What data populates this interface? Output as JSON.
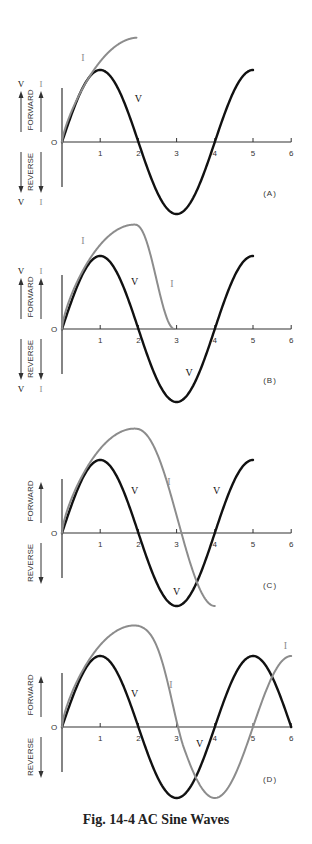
{
  "caption": "Fig. 14-4 AC Sine Waves",
  "colors": {
    "voltage": "#111111",
    "current": "#8c8c8c",
    "axis": "#333333",
    "text": "#333333"
  },
  "axis_labels": {
    "forward": "FORWARD",
    "reverse": "REVERSE",
    "origin": "O",
    "v": "V",
    "i": "I"
  },
  "chart_data": [
    {
      "type": "line",
      "panel": "(A)",
      "title": "(A)",
      "xlabel": "",
      "ylabel": "FORWARD / REVERSE",
      "x_ticks": [
        "1",
        "2",
        "3",
        "4",
        "5",
        "6"
      ],
      "xlim": [
        0,
        6
      ],
      "ylim": [
        -1,
        1
      ],
      "side_labels": {
        "top": [
          "V",
          "I"
        ],
        "bottom": [
          "V",
          "I"
        ]
      },
      "series": [
        {
          "name": "V",
          "kind": "sine",
          "x_start": 0,
          "x_end": 5,
          "amplitude": 1.0,
          "period": 4,
          "phase": 0
        },
        {
          "name": "I",
          "kind": "rise",
          "x_start": 0,
          "x_end": 1.95,
          "peak": 1.45,
          "fall_end": null
        }
      ],
      "annotations": [
        {
          "text": "V",
          "x": 2.0,
          "y": 0.55
        },
        {
          "text": "I",
          "x": 0.55,
          "y": 1.12
        }
      ]
    },
    {
      "type": "line",
      "panel": "(B)",
      "title": "(B)",
      "x_ticks": [
        "1",
        "2",
        "3",
        "4",
        "5",
        "6"
      ],
      "xlim": [
        0,
        6
      ],
      "ylim": [
        -1,
        1
      ],
      "side_labels": {
        "top": [
          "V",
          "I"
        ],
        "bottom": [
          "V",
          "I"
        ]
      },
      "series": [
        {
          "name": "V",
          "kind": "sine",
          "x_start": 0,
          "x_end": 5,
          "amplitude": 1.0,
          "period": 4,
          "phase": 0
        },
        {
          "name": "I",
          "kind": "rise-fall",
          "x_start": 0,
          "peak_x": 1.9,
          "peak": 1.43,
          "x_end": 2.95,
          "end_y": 0
        }
      ],
      "annotations": [
        {
          "text": "V",
          "x": 1.9,
          "y": 0.6
        },
        {
          "text": "I",
          "x": 0.55,
          "y": 1.17
        },
        {
          "text": "I",
          "x": 2.88,
          "y": 0.58
        },
        {
          "text": "V",
          "x": 3.33,
          "y": -0.65
        }
      ]
    },
    {
      "type": "line",
      "panel": "(C)",
      "title": "(C)",
      "x_ticks": [
        "1",
        "2",
        "3",
        "4",
        "5",
        "6"
      ],
      "xlim": [
        0,
        6
      ],
      "ylim": [
        -1,
        1
      ],
      "side_labels": null,
      "series": [
        {
          "name": "V",
          "kind": "sine",
          "x_start": 0,
          "x_end": 5,
          "amplitude": 1.0,
          "period": 4,
          "phase": 0
        },
        {
          "name": "I",
          "kind": "rise-fall",
          "x_start": 0,
          "peak_x": 1.9,
          "peak": 1.43,
          "x_end": 4.0,
          "end_y": -1.0
        }
      ],
      "annotations": [
        {
          "text": "V",
          "x": 1.9,
          "y": 0.53
        },
        {
          "text": "I",
          "x": 2.8,
          "y": 0.66
        },
        {
          "text": "V",
          "x": 4.05,
          "y": 0.53
        },
        {
          "text": "V",
          "x": 3.0,
          "y": -0.85
        }
      ]
    },
    {
      "type": "line",
      "panel": "(D)",
      "title": "(D)",
      "x_ticks": [
        "1",
        "2",
        "3",
        "4",
        "5",
        "6"
      ],
      "xlim": [
        0,
        6
      ],
      "ylim": [
        -1,
        1
      ],
      "side_labels": null,
      "series": [
        {
          "name": "V",
          "kind": "sine",
          "x_start": 0,
          "x_end": 6,
          "amplitude": 1.0,
          "period": 4,
          "phase": 0
        },
        {
          "name": "I",
          "kind": "rise-fall-sine",
          "x_start": 0,
          "peak_x": 1.9,
          "peak": 1.43,
          "x_end": 6.0,
          "lag": 1.0
        }
      ],
      "annotations": [
        {
          "text": "V",
          "x": 1.9,
          "y": 0.42
        },
        {
          "text": "I",
          "x": 2.85,
          "y": 0.55
        },
        {
          "text": "V",
          "x": 3.6,
          "y": -0.28
        },
        {
          "text": "I",
          "x": 5.85,
          "y": 1.1
        }
      ]
    }
  ]
}
